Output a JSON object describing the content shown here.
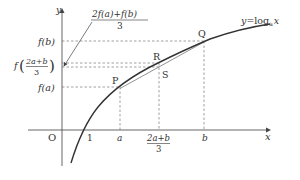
{
  "diagram": {
    "curve_label": "y=log",
    "curve_label_sub": "a",
    "curve_label_var": "x",
    "axes": {
      "x_label": "x",
      "y_label": "y",
      "origin_label": "O"
    },
    "x_ticks": {
      "one": "1",
      "a": "a",
      "mid_num": "2a+b",
      "mid_den": "3",
      "b": "b"
    },
    "y_ticks": {
      "fb": "f(b)",
      "fmid_prefix": "f",
      "fmid_num": "2a+b",
      "fmid_den": "3",
      "fa": "f(a)"
    },
    "callout": {
      "numerator": "2f(a)+f(b)",
      "denominator": "3"
    },
    "points": {
      "P": "P",
      "R": "R",
      "S": "S",
      "Q": "Q"
    },
    "colors": {
      "curve": "#333333",
      "axis": "#555555",
      "dashed": "#888888",
      "chord": "#777777"
    }
  }
}
